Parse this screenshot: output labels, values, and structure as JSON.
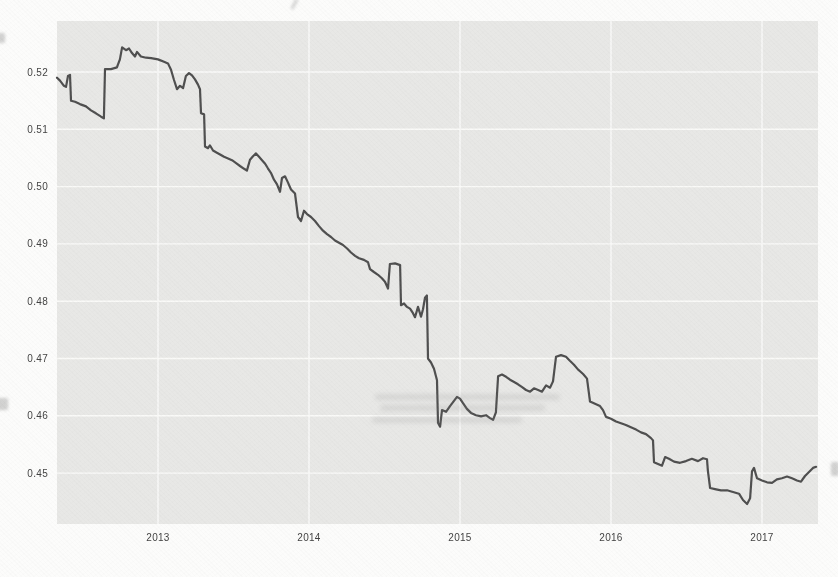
{
  "page": {
    "background_color": "#fcfcfb"
  },
  "chart_data": {
    "type": "line",
    "interpolation": "step-like",
    "title": "",
    "subtitle": "",
    "xlabel": "",
    "ylabel": "",
    "legend": null,
    "grid": true,
    "panel_color": "#e8e8e6",
    "grid_color": "#fafaf8",
    "line_color": "#4d4d4d",
    "tick_label_color": "#3f3f3f",
    "xlim": [
      2012.33,
      2017.37
    ],
    "ylim": [
      0.4412,
      0.5289
    ],
    "x_ticks": [
      "2013",
      "2014",
      "2015",
      "2016",
      "2017"
    ],
    "x_tick_values": [
      2013,
      2014,
      2015,
      2016,
      2017
    ],
    "y_ticks": [
      "0.52",
      "0.51",
      "0.50",
      "0.49",
      "0.48",
      "0.47",
      "0.46",
      "0.45"
    ],
    "y_tick_values": [
      0.52,
      0.51,
      0.5,
      0.49,
      0.48,
      0.47,
      0.46,
      0.45
    ],
    "series": [
      {
        "name": "value",
        "points": [
          [
            2012.331,
            0.519
          ],
          [
            2012.351,
            0.5185
          ],
          [
            2012.377,
            0.5176
          ],
          [
            2012.391,
            0.5174
          ],
          [
            2012.404,
            0.5193
          ],
          [
            2012.417,
            0.5195
          ],
          [
            2012.424,
            0.515
          ],
          [
            2012.45,
            0.5148
          ],
          [
            2012.483,
            0.5144
          ],
          [
            2012.523,
            0.514
          ],
          [
            2012.556,
            0.5133
          ],
          [
            2012.589,
            0.5128
          ],
          [
            2012.623,
            0.5122
          ],
          [
            2012.642,
            0.5119
          ],
          [
            2012.649,
            0.5205
          ],
          [
            2012.689,
            0.5205
          ],
          [
            2012.728,
            0.5208
          ],
          [
            2012.748,
            0.5222
          ],
          [
            2012.762,
            0.5243
          ],
          [
            2012.788,
            0.5238
          ],
          [
            2012.808,
            0.5241
          ],
          [
            2012.828,
            0.5233
          ],
          [
            2012.848,
            0.5227
          ],
          [
            2012.861,
            0.5235
          ],
          [
            2012.887,
            0.5227
          ],
          [
            2012.921,
            0.5225
          ],
          [
            2012.954,
            0.5224
          ],
          [
            2013.0,
            0.5222
          ],
          [
            2013.04,
            0.5218
          ],
          [
            2013.066,
            0.5215
          ],
          [
            2013.086,
            0.5204
          ],
          [
            2013.106,
            0.5186
          ],
          [
            2013.126,
            0.517
          ],
          [
            2013.146,
            0.5176
          ],
          [
            2013.166,
            0.5172
          ],
          [
            2013.185,
            0.5193
          ],
          [
            2013.205,
            0.5198
          ],
          [
            2013.225,
            0.5194
          ],
          [
            2013.245,
            0.5187
          ],
          [
            2013.265,
            0.5178
          ],
          [
            2013.278,
            0.517
          ],
          [
            2013.285,
            0.5128
          ],
          [
            2013.305,
            0.5126
          ],
          [
            2013.311,
            0.507
          ],
          [
            2013.331,
            0.5067
          ],
          [
            2013.344,
            0.5072
          ],
          [
            2013.364,
            0.5063
          ],
          [
            2013.384,
            0.506
          ],
          [
            2013.411,
            0.5056
          ],
          [
            2013.437,
            0.5052
          ],
          [
            2013.464,
            0.5049
          ],
          [
            2013.49,
            0.5046
          ],
          [
            2013.517,
            0.5041
          ],
          [
            2013.543,
            0.5036
          ],
          [
            2013.57,
            0.5031
          ],
          [
            2013.589,
            0.5028
          ],
          [
            2013.609,
            0.5047
          ],
          [
            2013.629,
            0.5053
          ],
          [
            2013.649,
            0.5058
          ],
          [
            2013.669,
            0.5052
          ],
          [
            2013.689,
            0.5046
          ],
          [
            2013.709,
            0.504
          ],
          [
            2013.728,
            0.5032
          ],
          [
            2013.748,
            0.5024
          ],
          [
            2013.768,
            0.5012
          ],
          [
            2013.788,
            0.5004
          ],
          [
            2013.808,
            0.4991
          ],
          [
            2013.821,
            0.5015
          ],
          [
            2013.841,
            0.5018
          ],
          [
            2013.861,
            0.5007
          ],
          [
            2013.881,
            0.4995
          ],
          [
            2013.907,
            0.4988
          ],
          [
            2013.927,
            0.4947
          ],
          [
            2013.947,
            0.494
          ],
          [
            2013.967,
            0.4958
          ],
          [
            2013.987,
            0.4952
          ],
          [
            2014.013,
            0.4947
          ],
          [
            2014.04,
            0.494
          ],
          [
            2014.066,
            0.4931
          ],
          [
            2014.093,
            0.4923
          ],
          [
            2014.119,
            0.4917
          ],
          [
            2014.146,
            0.4912
          ],
          [
            2014.172,
            0.4906
          ],
          [
            2014.199,
            0.4902
          ],
          [
            2014.225,
            0.4898
          ],
          [
            2014.252,
            0.4892
          ],
          [
            2014.278,
            0.4885
          ],
          [
            2014.305,
            0.4879
          ],
          [
            2014.331,
            0.4875
          ],
          [
            2014.364,
            0.4872
          ],
          [
            2014.391,
            0.4868
          ],
          [
            2014.404,
            0.4856
          ],
          [
            2014.43,
            0.4851
          ],
          [
            2014.457,
            0.4846
          ],
          [
            2014.483,
            0.484
          ],
          [
            2014.503,
            0.4834
          ],
          [
            2014.523,
            0.4822
          ],
          [
            2014.536,
            0.4865
          ],
          [
            2014.57,
            0.4866
          ],
          [
            2014.603,
            0.4863
          ],
          [
            2014.609,
            0.4793
          ],
          [
            2014.629,
            0.4796
          ],
          [
            2014.649,
            0.479
          ],
          [
            2014.669,
            0.4787
          ],
          [
            2014.689,
            0.4779
          ],
          [
            2014.702,
            0.4772
          ],
          [
            2014.722,
            0.479
          ],
          [
            2014.742,
            0.4773
          ],
          [
            2014.755,
            0.4786
          ],
          [
            2014.768,
            0.4806
          ],
          [
            2014.781,
            0.481
          ],
          [
            2014.788,
            0.47
          ],
          [
            2014.808,
            0.4693
          ],
          [
            2014.828,
            0.4682
          ],
          [
            2014.848,
            0.4662
          ],
          [
            2014.854,
            0.4588
          ],
          [
            2014.868,
            0.4581
          ],
          [
            2014.881,
            0.461
          ],
          [
            2014.907,
            0.4607
          ],
          [
            2014.934,
            0.4617
          ],
          [
            2014.96,
            0.4626
          ],
          [
            2014.98,
            0.4633
          ],
          [
            2015.0,
            0.463
          ],
          [
            2015.02,
            0.4622
          ],
          [
            2015.046,
            0.4612
          ],
          [
            2015.073,
            0.4605
          ],
          [
            2015.106,
            0.4601
          ],
          [
            2015.139,
            0.4599
          ],
          [
            2015.172,
            0.4601
          ],
          [
            2015.199,
            0.4596
          ],
          [
            2015.219,
            0.4593
          ],
          [
            2015.238,
            0.4606
          ],
          [
            2015.252,
            0.4669
          ],
          [
            2015.278,
            0.4672
          ],
          [
            2015.305,
            0.4668
          ],
          [
            2015.331,
            0.4663
          ],
          [
            2015.358,
            0.4659
          ],
          [
            2015.384,
            0.4655
          ],
          [
            2015.411,
            0.465
          ],
          [
            2015.437,
            0.4645
          ],
          [
            2015.464,
            0.4642
          ],
          [
            2015.49,
            0.4648
          ],
          [
            2015.517,
            0.4645
          ],
          [
            2015.543,
            0.4642
          ],
          [
            2015.57,
            0.4653
          ],
          [
            2015.596,
            0.4649
          ],
          [
            2015.616,
            0.466
          ],
          [
            2015.636,
            0.4703
          ],
          [
            2015.669,
            0.4706
          ],
          [
            2015.702,
            0.4703
          ],
          [
            2015.728,
            0.4696
          ],
          [
            2015.755,
            0.4689
          ],
          [
            2015.781,
            0.4681
          ],
          [
            2015.815,
            0.4673
          ],
          [
            2015.841,
            0.4665
          ],
          [
            2015.861,
            0.4625
          ],
          [
            2015.894,
            0.4621
          ],
          [
            2015.927,
            0.4617
          ],
          [
            2015.947,
            0.461
          ],
          [
            2015.967,
            0.4598
          ],
          [
            2016.0,
            0.4595
          ],
          [
            2016.033,
            0.459
          ],
          [
            2016.066,
            0.4587
          ],
          [
            2016.099,
            0.4584
          ],
          [
            2016.132,
            0.458
          ],
          [
            2016.166,
            0.4576
          ],
          [
            2016.199,
            0.4571
          ],
          [
            2016.232,
            0.4568
          ],
          [
            2016.265,
            0.4561
          ],
          [
            2016.278,
            0.4557
          ],
          [
            2016.285,
            0.4519
          ],
          [
            2016.311,
            0.4516
          ],
          [
            2016.338,
            0.4513
          ],
          [
            2016.358,
            0.4528
          ],
          [
            2016.384,
            0.4525
          ],
          [
            2016.417,
            0.452
          ],
          [
            2016.457,
            0.4518
          ],
          [
            2016.497,
            0.4521
          ],
          [
            2016.536,
            0.4525
          ],
          [
            2016.576,
            0.4521
          ],
          [
            2016.609,
            0.4526
          ],
          [
            2016.636,
            0.4524
          ],
          [
            2016.642,
            0.4504
          ],
          [
            2016.656,
            0.4474
          ],
          [
            2016.689,
            0.4472
          ],
          [
            2016.728,
            0.447
          ],
          [
            2016.768,
            0.447
          ],
          [
            2016.808,
            0.4467
          ],
          [
            2016.848,
            0.4464
          ],
          [
            2016.874,
            0.4453
          ],
          [
            2016.901,
            0.4446
          ],
          [
            2016.921,
            0.4456
          ],
          [
            2016.934,
            0.4503
          ],
          [
            2016.947,
            0.4509
          ],
          [
            2016.967,
            0.4491
          ],
          [
            2017.0,
            0.4487
          ],
          [
            2017.033,
            0.4484
          ],
          [
            2017.066,
            0.4483
          ],
          [
            2017.099,
            0.4489
          ],
          [
            2017.132,
            0.4491
          ],
          [
            2017.166,
            0.4494
          ],
          [
            2017.199,
            0.4491
          ],
          [
            2017.232,
            0.4487
          ],
          [
            2017.258,
            0.4485
          ],
          [
            2017.285,
            0.4495
          ],
          [
            2017.311,
            0.4502
          ],
          [
            2017.338,
            0.4509
          ],
          [
            2017.358,
            0.4511
          ]
        ]
      }
    ]
  }
}
